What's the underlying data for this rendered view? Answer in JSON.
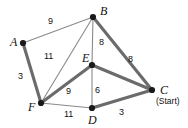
{
  "figure": {
    "width": 188,
    "height": 128,
    "background": "#ffffff",
    "edge_color_thick": "#6b6b6b",
    "edge_color_thin": "#8a8a8a",
    "vertex_color": "#1a1a1a",
    "text_color": "#111111"
  },
  "chart_data": {
    "type": "diagram",
    "subtype": "weighted-undirected-graph",
    "start_vertex": "C",
    "start_annotation": "(Start)",
    "nodes": [
      {
        "id": "A",
        "label": "A",
        "x": 23,
        "y": 43,
        "label_x": 10,
        "label_y": 36
      },
      {
        "id": "B",
        "label": "B",
        "x": 93,
        "y": 17,
        "label_x": 100,
        "label_y": 5
      },
      {
        "id": "C",
        "label": "C",
        "x": 152,
        "y": 90,
        "label_x": 160,
        "label_y": 84
      },
      {
        "id": "D",
        "label": "D",
        "x": 92,
        "y": 108,
        "label_x": 88,
        "label_y": 114
      },
      {
        "id": "E",
        "label": "E",
        "x": 92,
        "y": 65,
        "label_x": 82,
        "label_y": 52
      },
      {
        "id": "F",
        "label": "F",
        "x": 41,
        "y": 103,
        "label_x": 28,
        "label_y": 101
      }
    ],
    "edges": [
      {
        "from": "A",
        "to": "B",
        "weight": 9,
        "weight_x": 48,
        "weight_y": 17,
        "style": "thin"
      },
      {
        "from": "A",
        "to": "F",
        "weight": 3,
        "weight_x": 18,
        "weight_y": 72,
        "style": "thick"
      },
      {
        "from": "B",
        "to": "F",
        "weight": 11,
        "weight_x": 44,
        "weight_y": 52,
        "style": "thin"
      },
      {
        "from": "B",
        "to": "E",
        "weight": 8,
        "weight_x": 99,
        "weight_y": 38,
        "style": "thin"
      },
      {
        "from": "B",
        "to": "C",
        "weight": 8,
        "weight_x": 128,
        "weight_y": 55,
        "style": "thick"
      },
      {
        "from": "F",
        "to": "E",
        "weight": 9,
        "weight_x": 66,
        "weight_y": 87,
        "style": "thick"
      },
      {
        "from": "F",
        "to": "D",
        "weight": 11,
        "weight_x": 64,
        "weight_y": 110,
        "style": "thin"
      },
      {
        "from": "E",
        "to": "D",
        "weight": 6,
        "weight_x": 95,
        "weight_y": 86,
        "style": "thin"
      },
      {
        "from": "E",
        "to": "C",
        "weight": null,
        "weight_x": null,
        "weight_y": null,
        "style": "thick"
      },
      {
        "from": "D",
        "to": "C",
        "weight": 3,
        "weight_x": 119,
        "weight_y": 108,
        "style": "thick"
      }
    ],
    "weight_labels": [
      "9",
      "3",
      "11",
      "8",
      "8",
      "9",
      "11",
      "6",
      "3"
    ],
    "vertex_labels": [
      "A",
      "B",
      "C",
      "D",
      "E",
      "F"
    ]
  }
}
